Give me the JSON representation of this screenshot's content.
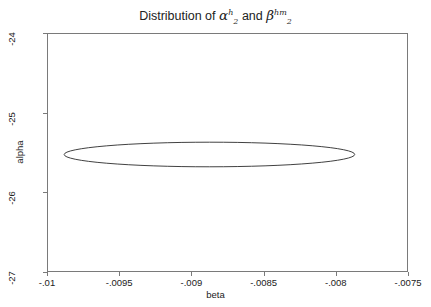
{
  "chart_data": {
    "type": "scatter",
    "title_parts": {
      "prefix": "Distribution of ",
      "sym1": "α",
      "sym1_sup": "h",
      "sym1_sub": "2",
      "conjunction": " and ",
      "sym2": "β",
      "sym2_sup": "hm",
      "sym2_sub": "2"
    },
    "xlabel": "beta",
    "ylabel": "alpha",
    "xlim": [
      -0.01,
      -0.0075
    ],
    "ylim": [
      -27,
      -24
    ],
    "xticks": [
      -0.01,
      -0.0095,
      -0.009,
      -0.0085,
      -0.008,
      -0.0075
    ],
    "xticklabels": [
      "-.01",
      "-.0095",
      "-.009",
      "-.0085",
      "-.008",
      "-.0075"
    ],
    "yticks": [
      -24,
      -25,
      -26,
      -27
    ],
    "yticklabels": [
      "-24",
      "-25",
      "-26",
      "-27"
    ],
    "grid": false,
    "legend": null,
    "series": [
      {
        "name": "confidence-ellipse",
        "shape": "ellipse",
        "center": [
          -0.008875,
          -25.525
        ],
        "semi_major": 0.00118,
        "semi_minor": 0.000163,
        "rotation_deg": 31.5,
        "stroke": "#2b2b2b",
        "fill": "none",
        "stroke_width": 0.9,
        "extent_x": [
          -0.009647,
          -0.007847
        ],
        "extent_y": [
          -24.603,
          -26.598
        ]
      }
    ],
    "colors": {
      "axis": "#7a7a7a",
      "text": "#222222",
      "curve": "#2b2b2b",
      "background": "#ffffff"
    }
  }
}
